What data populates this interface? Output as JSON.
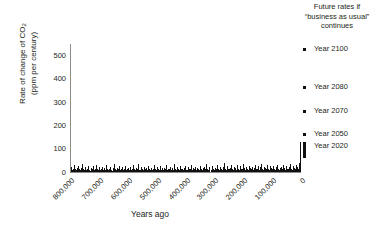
{
  "chart_data": {
    "type": "bar",
    "title": "",
    "xlabel": "Years ago",
    "ylabel_line1": "Rate of change of CO",
    "ylabel_sub": "2",
    "ylabel_line2": "(ppm per century)",
    "ylim": [
      0,
      550
    ],
    "yticks": [
      0,
      100,
      200,
      300,
      400,
      500
    ],
    "ytick_labels": [
      "0",
      "100",
      "200",
      "300",
      "400",
      "500"
    ],
    "xlim": [
      800000,
      0
    ],
    "xticks": [
      800000,
      700000,
      600000,
      500000,
      400000,
      300000,
      200000,
      100000,
      0
    ],
    "xtick_labels": [
      "800,000",
      "700,000",
      "600,000",
      "500,000",
      "400,000",
      "300,000",
      "200,000",
      "100,000",
      "0"
    ],
    "grid": false,
    "legend_position": "right",
    "series_name": "Ice-core CO2 rate of change",
    "bar_color": "#111111",
    "axis_color": "#8c8c8c",
    "x": [
      798000,
      794500,
      791000,
      787500,
      784000,
      780500,
      777000,
      773500,
      770000,
      766500,
      763000,
      759500,
      756000,
      752500,
      749000,
      745500,
      742000,
      738500,
      735000,
      731500,
      728000,
      724500,
      721000,
      717500,
      714000,
      710500,
      707000,
      703500,
      700000,
      696500,
      693000,
      689500,
      686000,
      682500,
      679000,
      675500,
      672000,
      668500,
      665000,
      661500,
      658000,
      654500,
      651000,
      647500,
      644000,
      640500,
      637000,
      633500,
      630000,
      626500,
      623000,
      619500,
      616000,
      612500,
      609000,
      605500,
      602000,
      598500,
      595000,
      591500,
      588000,
      584500,
      581000,
      577500,
      574000,
      570500,
      567000,
      563500,
      560000,
      556500,
      553000,
      549500,
      546000,
      542500,
      539000,
      535500,
      532000,
      528500,
      525000,
      521500,
      518000,
      514500,
      511000,
      507500,
      504000,
      500500,
      497000,
      493500,
      490000,
      486500,
      483000,
      479500,
      476000,
      472500,
      469000,
      465500,
      462000,
      458500,
      455000,
      451500,
      448000,
      444500,
      441000,
      437500,
      434000,
      430500,
      427000,
      423500,
      420000,
      416500,
      413000,
      409500,
      406000,
      402500,
      399000,
      395500,
      392000,
      388500,
      385000,
      381500,
      378000,
      374500,
      371000,
      367500,
      364000,
      360500,
      357000,
      353500,
      350000,
      346500,
      343000,
      339500,
      336000,
      332500,
      329000,
      325500,
      322000,
      318500,
      315000,
      311500,
      308000,
      304500,
      301000,
      297500,
      294000,
      290500,
      287000,
      283500,
      280000,
      276500,
      273000,
      269500,
      266000,
      262500,
      259000,
      255500,
      252000,
      248500,
      245000,
      241500,
      238000,
      234500,
      231000,
      227500,
      224000,
      220500,
      217000,
      213500,
      210000,
      206500,
      203000,
      199500,
      196000,
      192500,
      189000,
      185500,
      182000,
      178500,
      175000,
      171500,
      168000,
      164500,
      161000,
      157500,
      154000,
      150500,
      147000,
      143500,
      140000,
      136500,
      133000,
      129500,
      126000,
      122500,
      119000,
      115500,
      112000,
      108500,
      105000,
      101500,
      98000,
      94500,
      91000,
      87500,
      84000,
      80500,
      77000,
      73500,
      70000,
      66500,
      63000,
      59500,
      56000,
      52500,
      49000,
      45500,
      42000,
      38500,
      35000,
      31500,
      28000,
      24500,
      21000,
      17500,
      14000,
      10500,
      7000,
      3500,
      500
    ],
    "values": [
      22,
      9,
      14,
      31,
      12,
      8,
      19,
      26,
      11,
      7,
      16,
      34,
      13,
      9,
      21,
      8,
      15,
      27,
      10,
      6,
      18,
      12,
      25,
      9,
      14,
      30,
      11,
      8,
      20,
      7,
      13,
      23,
      10,
      17,
      9,
      28,
      12,
      8,
      15,
      22,
      10,
      6,
      19,
      33,
      12,
      9,
      16,
      11,
      24,
      8,
      14,
      20,
      9,
      12,
      26,
      7,
      15,
      18,
      10,
      22,
      8,
      13,
      29,
      11,
      9,
      17,
      12,
      35,
      10,
      7,
      20,
      14,
      9,
      23,
      11,
      16,
      8,
      27,
      12,
      10,
      18,
      9,
      14,
      31,
      11,
      7,
      21,
      13,
      9,
      25,
      10,
      16,
      8,
      19,
      12,
      28,
      9,
      14,
      11,
      22,
      7,
      17,
      10,
      33,
      12,
      9,
      20,
      15,
      8,
      24,
      11,
      13,
      9,
      18,
      26,
      10,
      7,
      21,
      14,
      12,
      30,
      9,
      16,
      11,
      23,
      8,
      19,
      13,
      10,
      27,
      12,
      9,
      17,
      22,
      11,
      35,
      14,
      8,
      20,
      10,
      25,
      13,
      9,
      18,
      12,
      29,
      11,
      7,
      23,
      15,
      10,
      21,
      38,
      12,
      9,
      26,
      14,
      11,
      19,
      31,
      13,
      8,
      22,
      17,
      10,
      28,
      12,
      9,
      24,
      15,
      11,
      33,
      18,
      10,
      21,
      13,
      9,
      27,
      16,
      12,
      23,
      8,
      19,
      30,
      11,
      14,
      25,
      10,
      20,
      36,
      13,
      9,
      22,
      17,
      12,
      29,
      15,
      10,
      24,
      18,
      11,
      26,
      14,
      9,
      21,
      32,
      13,
      10,
      19,
      23,
      12,
      28,
      16,
      9,
      25,
      14,
      11,
      20,
      34,
      13,
      10,
      27,
      18,
      12,
      30,
      22,
      15,
      40,
      131
    ],
    "annotations": [
      {
        "text": "Modern spike: rate of change rises sharply to ~130 ppm per century near present day",
        "x": 500,
        "value": 131
      }
    ],
    "legend_title_lines": [
      "Future rates if",
      "“business as usual”",
      "continues"
    ],
    "legend_items": [
      {
        "label": "Year 2100",
        "value": 500,
        "marker": "dot",
        "top": 44
      },
      {
        "label": "Year 2080",
        "value": 350,
        "marker": "dot",
        "top": 82
      },
      {
        "label": "Year 2070",
        "value": 250,
        "marker": "dot",
        "top": 106
      },
      {
        "label": "Year 2050",
        "value": 160,
        "marker": "dot",
        "top": 129
      },
      {
        "label": "Year 2020",
        "value": 131,
        "marker": "bar",
        "top": 141
      }
    ]
  }
}
